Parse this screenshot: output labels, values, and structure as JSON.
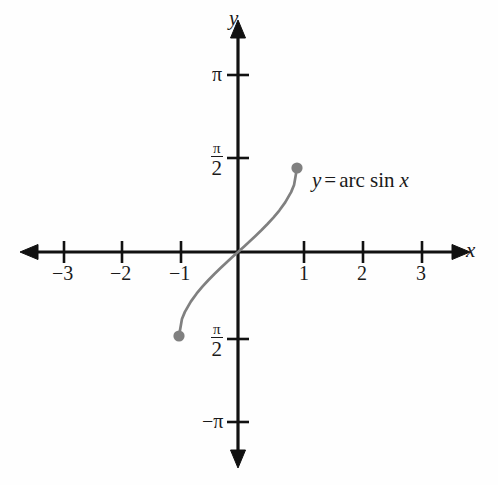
{
  "figure": {
    "background_color": "#fefefe",
    "axis_color": "#111111",
    "curve_color": "#808080",
    "point_color": "#808080"
  },
  "axes": {
    "x_label": "x",
    "y_label": "y",
    "origin_px": [
      238,
      252
    ],
    "x_unit_px": 59,
    "y_halfpi_px": 84
  },
  "ticks": {
    "x": [
      {
        "label": "−3",
        "value": -3,
        "px": 64
      },
      {
        "label": "−2",
        "value": -2,
        "px": 122
      },
      {
        "label": "−1",
        "value": -1,
        "px": 181
      },
      {
        "label": "1",
        "value": 1,
        "px": 304
      },
      {
        "label": "2",
        "value": 2,
        "px": 363
      },
      {
        "label": "3",
        "value": 3,
        "px": 422
      }
    ],
    "y": [
      {
        "label": "π",
        "kind": "plain",
        "value": 3.1416,
        "px": 75
      },
      {
        "label": "π/2",
        "kind": "fraction",
        "numerator": "π",
        "denominator": "2",
        "sign": "",
        "value": 1.5708,
        "px": 158
      },
      {
        "label": "π/2",
        "kind": "fraction",
        "numerator": "π",
        "denominator": "2",
        "sign": "",
        "value": -1.5708,
        "px": 339
      },
      {
        "label": "−π",
        "kind": "plain",
        "value": -3.1416,
        "px": 422
      }
    ]
  },
  "annotation": {
    "equation_y": "y",
    "equation_equals": "=",
    "equation_fn": "arc sin",
    "equation_var": "x",
    "equation_full": "y = arc sin x",
    "px": [
      312,
      182
    ]
  },
  "endpoints": [
    {
      "name": "upper-endpoint",
      "x": 1,
      "y": 1.5708,
      "px": [
        305,
        158
      ]
    },
    {
      "name": "lower-endpoint",
      "x": -1,
      "y": -1.5708,
      "px": [
        181,
        339
      ]
    }
  ],
  "chart_data": {
    "type": "line",
    "title": "",
    "xlabel": "x",
    "ylabel": "y",
    "xlim": [
      -3.6,
      3.6
    ],
    "ylim": [
      -3.6,
      3.6
    ],
    "grid": false,
    "legend": "none",
    "series": [
      {
        "name": "y = arc sin x",
        "color": "#808080",
        "domain": [
          -1,
          1
        ],
        "range": [
          -1.5708,
          1.5708
        ],
        "endpoints_filled": true,
        "x": [
          -1,
          -0.95,
          -0.9,
          -0.8,
          -0.7,
          -0.6,
          -0.5,
          -0.4,
          -0.3,
          -0.2,
          -0.1,
          0,
          0.1,
          0.2,
          0.3,
          0.4,
          0.5,
          0.6,
          0.7,
          0.8,
          0.9,
          0.95,
          1
        ],
        "y": [
          -1.5708,
          -1.2532,
          -1.1198,
          -0.9273,
          -0.7754,
          -0.6435,
          -0.5236,
          -0.4115,
          -0.3047,
          -0.2014,
          -0.1002,
          0,
          0.1002,
          0.2014,
          0.3047,
          0.4115,
          0.5236,
          0.6435,
          0.7754,
          0.9273,
          1.1198,
          1.2532,
          1.5708
        ]
      }
    ],
    "xticks": [
      -3,
      -2,
      -1,
      1,
      2,
      3
    ],
    "xticklabels": [
      "−3",
      "−2",
      "−1",
      "1",
      "2",
      "3"
    ],
    "yticks": [
      3.1416,
      1.5708,
      -1.5708,
      -3.1416
    ],
    "yticklabels": [
      "π",
      "π/2",
      "π/2",
      "−π"
    ],
    "annotations": [
      "y = arc sin x"
    ]
  }
}
